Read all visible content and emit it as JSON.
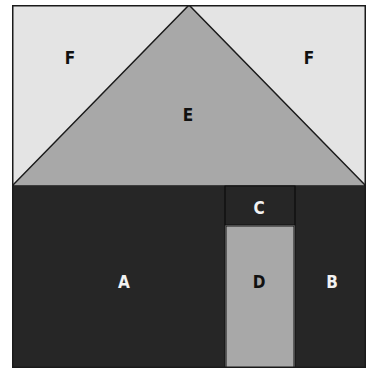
{
  "diagram": {
    "colors": {
      "background_F": "#e4e4e4",
      "roof_E": "#a8a8a8",
      "body_dark": "#262626",
      "door_D": "#a8a8a8",
      "outline": "#1a1a1a"
    },
    "regions": [
      {
        "id": "F_left",
        "label": "F"
      },
      {
        "id": "F_right",
        "label": "F"
      },
      {
        "id": "E",
        "label": "E"
      },
      {
        "id": "A",
        "label": "A"
      },
      {
        "id": "B",
        "label": "B"
      },
      {
        "id": "C",
        "label": "C"
      },
      {
        "id": "D",
        "label": "D"
      }
    ]
  }
}
